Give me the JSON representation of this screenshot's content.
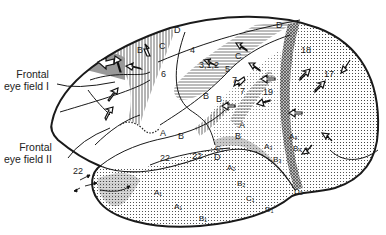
{
  "diagram": {
    "type": "anatomical-brain-lateral-view",
    "captions": {
      "frontal_eye_field_1": {
        "line1": "Frontal",
        "line2": "eye field I"
      },
      "frontal_eye_field_2": {
        "line1": "Frontal",
        "line2": "eye field II"
      }
    },
    "area_labels": {
      "a4": "4",
      "a312": "3,1,2",
      "a5": "5",
      "a7a": "7",
      "a7b": "7",
      "a6": "6",
      "a18": "18",
      "a17": "17",
      "a19": "19",
      "a22a": "22",
      "a22b": "22",
      "a22c": "22",
      "a8": "8"
    },
    "letter_labels": {
      "B_front": "B",
      "C_front": "C",
      "D_front_top": "D",
      "C_par": "C",
      "B_par1": "B",
      "B_par2": "B",
      "D_par": "D",
      "A_temp": "A",
      "B_temp": "B",
      "A_sup": "A",
      "B_sup": "B",
      "C1_sup": "C₁",
      "D_sup": "D",
      "A1_a": "A₁",
      "A1_b": "A₁",
      "B1": "B₁",
      "C1": "C₁",
      "D1": "D₁",
      "A2": "A₂",
      "B2": "B₂",
      "D2": "D₂",
      "A3": "A₃",
      "B3": "B₃",
      "A4": "A₄",
      "B4": "B₄"
    },
    "colors": {
      "outline": "#1a1a1a",
      "hatch": "#444444",
      "stipple": "#333333",
      "shade_dark": "#555555",
      "shade_mid": "#9a9a9a",
      "background": "#ffffff"
    }
  }
}
